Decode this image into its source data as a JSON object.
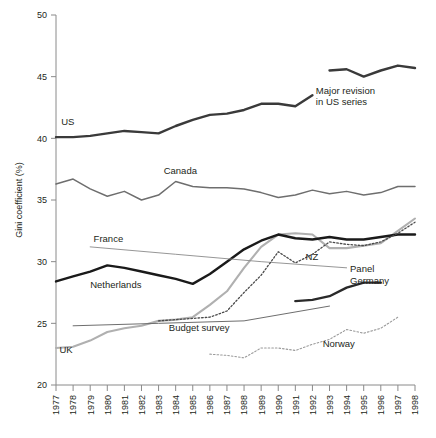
{
  "chart_data": {
    "type": "line",
    "title": "",
    "xlabel": "",
    "ylabel": "Gini coefficient (%)",
    "ylim": [
      20,
      50
    ],
    "yticks": [
      20,
      25,
      30,
      35,
      40,
      45,
      50
    ],
    "grid": false,
    "legend_position": "inline-labels",
    "x": [
      1977,
      1978,
      1979,
      1980,
      1981,
      1982,
      1983,
      1984,
      1985,
      1986,
      1987,
      1988,
      1989,
      1990,
      1991,
      1992,
      1993,
      1994,
      1995,
      1996,
      1997,
      1998
    ],
    "xticklabels": [
      "1977",
      "1978",
      "1979",
      "1980",
      "1981",
      "1982",
      "1983",
      "1984",
      "1985",
      "1986",
      "1987",
      "1988",
      "1989",
      "1990",
      "1991",
      "1992",
      "1993",
      "1994",
      "1995",
      "1996",
      "1997",
      "1998"
    ],
    "annotations": [
      {
        "text": "Major revision in US series",
        "lines": [
          "Major revision",
          "in US series"
        ],
        "x": 1992.2,
        "y": 43.6
      }
    ],
    "series": [
      {
        "name": "US",
        "label": "US",
        "color": "#3a3a3a",
        "width": 2.4,
        "style": "solid",
        "label_x": 1977.3,
        "label_y": 41.1,
        "x": [
          1977,
          1978,
          1979,
          1980,
          1981,
          1982,
          1983,
          1984,
          1985,
          1986,
          1987,
          1988,
          1989,
          1990,
          1991,
          1992
        ],
        "values": [
          40.1,
          40.1,
          40.2,
          40.4,
          40.6,
          40.5,
          40.4,
          41.0,
          41.5,
          41.9,
          42.0,
          42.3,
          42.8,
          42.8,
          42.6,
          43.5
        ]
      },
      {
        "name": "US revised",
        "label": "",
        "color": "#3a3a3a",
        "width": 2.4,
        "style": "solid",
        "x": [
          1993,
          1994,
          1995,
          1996,
          1997,
          1998
        ],
        "values": [
          45.5,
          45.6,
          45.0,
          45.5,
          45.9,
          45.7
        ]
      },
      {
        "name": "Canada",
        "label": "Canada",
        "color": "#6e6e6e",
        "width": 1.5,
        "style": "solid",
        "label_x": 1983.3,
        "label_y": 37.1,
        "x": [
          1977,
          1978,
          1979,
          1980,
          1981,
          1982,
          1983,
          1984,
          1985,
          1986,
          1987,
          1988,
          1989,
          1990,
          1991,
          1992,
          1993,
          1994,
          1995,
          1996,
          1997,
          1998
        ],
        "values": [
          36.3,
          36.7,
          35.9,
          35.3,
          35.7,
          35.0,
          35.4,
          36.5,
          36.1,
          36.0,
          36.0,
          35.9,
          35.6,
          35.2,
          35.4,
          35.8,
          35.5,
          35.7,
          35.4,
          35.6,
          36.1,
          36.1
        ]
      },
      {
        "name": "UK",
        "label": "UK",
        "color": "#b0b0b0",
        "width": 2.1,
        "style": "solid",
        "label_x": 1977.2,
        "label_y": 22.6,
        "x": [
          1977,
          1978,
          1979,
          1980,
          1981,
          1982,
          1983,
          1984,
          1985,
          1986,
          1987,
          1988,
          1989,
          1990,
          1991,
          1992,
          1993,
          1994,
          1995,
          1996,
          1997,
          1998
        ],
        "values": [
          23.0,
          23.1,
          23.6,
          24.3,
          24.6,
          24.8,
          25.2,
          25.3,
          25.5,
          26.5,
          27.6,
          29.5,
          31.2,
          32.2,
          32.3,
          32.2,
          31.1,
          31.1,
          31.3,
          31.5,
          32.5,
          33.5
        ]
      },
      {
        "name": "Netherlands",
        "label": "Netherlands",
        "color": "#1a1a1a",
        "width": 2.4,
        "style": "solid",
        "label_x": 1979.0,
        "label_y": 27.9,
        "x": [
          1977,
          1978,
          1979,
          1980,
          1981,
          1982,
          1983,
          1984,
          1985,
          1986,
          1987,
          1988,
          1989,
          1990,
          1991,
          1992,
          1993,
          1994,
          1995,
          1996,
          1997,
          1998
        ],
        "values": [
          28.4,
          28.8,
          29.2,
          29.7,
          29.5,
          29.2,
          28.9,
          28.6,
          28.2,
          29.0,
          30.0,
          31.0,
          31.7,
          32.2,
          31.9,
          31.8,
          32.0,
          31.8,
          31.8,
          32.0,
          32.2,
          32.2
        ]
      },
      {
        "name": "France",
        "label": "France",
        "color": "#8a8a8a",
        "width": 0.9,
        "style": "solid",
        "label_x": 1979.2,
        "label_y": 31.6,
        "x": [
          1979,
          1984,
          1989,
          1994
        ],
        "values": [
          31.2,
          30.6,
          30.0,
          29.5
        ]
      },
      {
        "name": "NZ",
        "label": "NZ",
        "color": "#4a4a4a",
        "width": 1.3,
        "style": "dotted",
        "label_x": 1991.6,
        "label_y": 30.1,
        "x": [
          1983,
          1984,
          1985,
          1986,
          1987,
          1988,
          1989,
          1990,
          1991,
          1992,
          1993,
          1994,
          1995,
          1996,
          1997,
          1998
        ],
        "values": [
          25.2,
          25.3,
          25.4,
          25.5,
          26.0,
          27.5,
          28.9,
          30.8,
          29.9,
          30.6,
          31.6,
          31.4,
          31.3,
          31.6,
          32.3,
          33.2
        ]
      },
      {
        "name": "Germany Panel",
        "label": "Panel",
        "color": "#2a2a2a",
        "width": 2.4,
        "style": "solid",
        "label_x": 1994.2,
        "label_y": 29.2,
        "x": [
          1991,
          1992,
          1993,
          1994,
          1995,
          1996
        ],
        "values": [
          26.8,
          26.9,
          27.2,
          27.9,
          28.3,
          28.3
        ]
      },
      {
        "name": "Germany Budget survey",
        "label": "Budget survey",
        "color": "#6e6e6e",
        "width": 1.0,
        "style": "solid",
        "label_x": 1983.6,
        "label_y": 24.4,
        "x": [
          1978,
          1983,
          1988,
          1993
        ],
        "values": [
          24.8,
          25.0,
          25.2,
          26.4
        ]
      },
      {
        "name": "Germany label",
        "label": "Germany",
        "color": "#2a2a2a",
        "width": 0,
        "style": "none",
        "label_x": 1994.2,
        "label_y": 28.2,
        "x": [],
        "values": []
      },
      {
        "name": "Norway",
        "label": "Norway",
        "color": "#9a9a9a",
        "width": 1.1,
        "style": "dotted",
        "label_x": 1992.6,
        "label_y": 23.1,
        "x": [
          1986,
          1987,
          1988,
          1989,
          1990,
          1991,
          1992,
          1993,
          1994,
          1995,
          1996,
          1997
        ],
        "values": [
          22.5,
          22.4,
          22.2,
          23.0,
          23.0,
          22.8,
          23.3,
          23.7,
          24.5,
          24.2,
          24.6,
          25.5
        ]
      }
    ]
  }
}
